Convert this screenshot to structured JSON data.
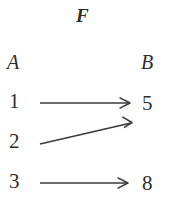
{
  "figure": {
    "title": "F",
    "background_color": "#ffffff",
    "stroke_color": "#3a3a3a",
    "text_color": "#2e2e2e",
    "width": 170,
    "height": 206
  },
  "domain_set": {
    "label": "A",
    "elements": [
      {
        "value": "1"
      },
      {
        "value": "2"
      },
      {
        "value": "3"
      }
    ]
  },
  "codomain_set": {
    "label": "B",
    "elements": [
      {
        "value": "5"
      },
      {
        "value": "8"
      }
    ]
  },
  "mappings": [
    {
      "from": "1",
      "to": "5",
      "style": "horizontal"
    },
    {
      "from": "2",
      "to": "5",
      "style": "diagonal-up"
    },
    {
      "from": "3",
      "to": "8",
      "style": "horizontal"
    }
  ]
}
